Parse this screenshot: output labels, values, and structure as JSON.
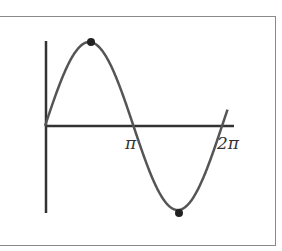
{
  "figure": {
    "x_ticks": [
      {
        "label": "π",
        "value": 3.14159
      },
      {
        "label": "2π",
        "value": 6.28318
      }
    ],
    "marked_points": [
      {
        "name": "maximum",
        "x": "π/2",
        "y": 1
      },
      {
        "name": "minimum",
        "x": "3π/2",
        "y": -1
      }
    ],
    "colors": {
      "curve": "#555555",
      "axis": "#333333",
      "point": "#222222",
      "frame": "#8a8a8a"
    }
  },
  "chart_data": {
    "type": "line",
    "title": "",
    "xlabel": "",
    "ylabel": "",
    "x_tick_labels": [
      "π",
      "2π"
    ],
    "series": [
      {
        "name": "y = sin x",
        "x": [
          0,
          0.785,
          1.571,
          2.356,
          3.142,
          3.927,
          4.712,
          5.498,
          6.283
        ],
        "values": [
          0,
          0.707,
          1,
          0.707,
          0,
          -0.707,
          -1,
          -0.707,
          0
        ]
      }
    ],
    "highlighted_points": [
      [
        1.571,
        1
      ],
      [
        4.712,
        -1
      ]
    ],
    "xlim": [
      0,
      6.4
    ],
    "ylim": [
      -1,
      1
    ],
    "grid": false,
    "legend": false
  }
}
